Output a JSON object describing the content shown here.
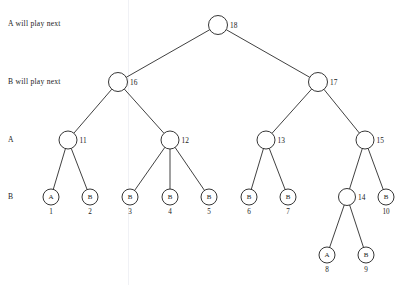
{
  "figure": {
    "name": "game-tree-diagram",
    "background_color": "#ffffff",
    "line_color": "#1f1f1f",
    "text_color": "#1a1a1a"
  },
  "row_labels": [
    {
      "id": "row-a-will-play-next",
      "text": "A will play next",
      "x": 8,
      "y": 24
    },
    {
      "id": "row-b-will-play-next",
      "text": "B will play next",
      "x": 8,
      "y": 82
    },
    {
      "id": "row-a",
      "text": "A",
      "x": 8,
      "y": 140
    },
    {
      "id": "row-b",
      "text": "B",
      "x": 8,
      "y": 197
    }
  ],
  "nodes": [
    {
      "id": "n18",
      "label": "18",
      "label_side": "right",
      "player": "",
      "x": 218,
      "y": 25,
      "r": 9.5,
      "level": 0
    },
    {
      "id": "n16",
      "label": "16",
      "label_side": "right",
      "player": "",
      "x": 118,
      "y": 82,
      "r": 9.5,
      "level": 1
    },
    {
      "id": "n17",
      "label": "17",
      "label_side": "right",
      "player": "",
      "x": 318,
      "y": 82,
      "r": 9.5,
      "level": 1
    },
    {
      "id": "n11",
      "label": "11",
      "label_side": "right",
      "player": "",
      "x": 68,
      "y": 140,
      "r": 9,
      "level": 2
    },
    {
      "id": "n12",
      "label": "12",
      "label_side": "right",
      "player": "",
      "x": 170,
      "y": 140,
      "r": 9,
      "level": 2
    },
    {
      "id": "n13",
      "label": "13",
      "label_side": "right",
      "player": "",
      "x": 266,
      "y": 140,
      "r": 9,
      "level": 2
    },
    {
      "id": "n15",
      "label": "15",
      "label_side": "right",
      "player": "",
      "x": 365,
      "y": 140,
      "r": 9,
      "level": 2
    },
    {
      "id": "n1",
      "label": "1",
      "label_side": "below",
      "player": "A",
      "x": 51,
      "y": 197,
      "r": 8,
      "level": 3
    },
    {
      "id": "n2",
      "label": "2",
      "label_side": "below",
      "player": "B",
      "x": 90,
      "y": 197,
      "r": 8,
      "level": 3
    },
    {
      "id": "n3",
      "label": "3",
      "label_side": "below",
      "player": "B",
      "x": 130,
      "y": 197,
      "r": 8,
      "level": 3
    },
    {
      "id": "n4",
      "label": "4",
      "label_side": "below",
      "player": "B",
      "x": 170,
      "y": 197,
      "r": 8,
      "level": 3
    },
    {
      "id": "n5",
      "label": "5",
      "label_side": "below",
      "player": "B",
      "x": 209,
      "y": 197,
      "r": 8,
      "level": 3
    },
    {
      "id": "n6",
      "label": "6",
      "label_side": "below",
      "player": "B",
      "x": 249,
      "y": 197,
      "r": 8,
      "level": 3
    },
    {
      "id": "n7",
      "label": "7",
      "label_side": "below",
      "player": "B",
      "x": 288,
      "y": 197,
      "r": 8,
      "level": 3
    },
    {
      "id": "n14",
      "label": "14",
      "label_side": "right",
      "player": "",
      "x": 347,
      "y": 197,
      "r": 8.5,
      "level": 3
    },
    {
      "id": "n10",
      "label": "10",
      "label_side": "below",
      "player": "B",
      "x": 386,
      "y": 197,
      "r": 8,
      "level": 3
    },
    {
      "id": "n8",
      "label": "8",
      "label_side": "below",
      "player": "A",
      "x": 327,
      "y": 255,
      "r": 8,
      "level": 4
    },
    {
      "id": "n9",
      "label": "9",
      "label_side": "below",
      "player": "B",
      "x": 366,
      "y": 255,
      "r": 8,
      "level": 4
    }
  ],
  "edges": [
    {
      "from": "n18",
      "to": "n16"
    },
    {
      "from": "n18",
      "to": "n17"
    },
    {
      "from": "n16",
      "to": "n11"
    },
    {
      "from": "n16",
      "to": "n12"
    },
    {
      "from": "n17",
      "to": "n13"
    },
    {
      "from": "n17",
      "to": "n15"
    },
    {
      "from": "n11",
      "to": "n1"
    },
    {
      "from": "n11",
      "to": "n2"
    },
    {
      "from": "n12",
      "to": "n3"
    },
    {
      "from": "n12",
      "to": "n4"
    },
    {
      "from": "n12",
      "to": "n5"
    },
    {
      "from": "n13",
      "to": "n6"
    },
    {
      "from": "n13",
      "to": "n7"
    },
    {
      "from": "n15",
      "to": "n14"
    },
    {
      "from": "n15",
      "to": "n10"
    },
    {
      "from": "n14",
      "to": "n8"
    },
    {
      "from": "n14",
      "to": "n9"
    }
  ]
}
